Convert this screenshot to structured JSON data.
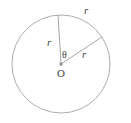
{
  "figure": {
    "type": "circle-sector-diagram",
    "background_color": "#ffffff",
    "stroke_color": "#9a9a9a",
    "text_color": "#3f3f3f",
    "circle": {
      "center_x": 61,
      "center_y": 64,
      "radius": 49
    },
    "center_point": {
      "x": 61,
      "y": 64,
      "dot_size": 3,
      "dot_color": "#7a7a7a"
    },
    "radii": [
      {
        "name": "radius-upper-left",
        "x1": 61,
        "y1": 64,
        "x2": 58,
        "y2": 15,
        "label": "r"
      },
      {
        "name": "radius-upper-right",
        "x1": 61,
        "y1": 64,
        "x2": 102,
        "y2": 37,
        "label": "r"
      }
    ],
    "labels": {
      "arc_r": "r",
      "left_r": "r",
      "right_r": "r",
      "theta": "θ",
      "center": "O"
    }
  }
}
